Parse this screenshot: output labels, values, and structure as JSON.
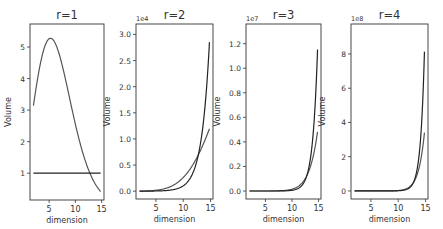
{
  "figure": {
    "width": 443,
    "height": 229
  },
  "chart_data": [
    {
      "type": "line",
      "title": "r=1",
      "xlabel": "dimension",
      "ylabel": "Volume",
      "offset_label": "",
      "r": 1,
      "x_range": [
        2,
        14.8
      ],
      "xlim": [
        1.35,
        15.45
      ],
      "ylim": [
        0.15,
        5.73
      ],
      "xticks": [
        5,
        10,
        15
      ],
      "yticks": [
        1,
        2,
        3,
        4,
        5
      ],
      "ytick_labels": [
        "1",
        "2",
        "3",
        "4",
        "5"
      ],
      "frame": {
        "left": 30,
        "top": 24,
        "right": 104,
        "bottom": 200
      },
      "x": [
        2,
        3,
        4,
        5,
        6,
        7,
        8,
        9,
        10,
        11,
        12,
        13,
        14,
        15
      ],
      "series": [
        {
          "name": "n-ball volume",
          "color": "#555555",
          "values": [
            3.1416,
            4.1888,
            4.9348,
            5.2638,
            5.1677,
            4.7248,
            4.0587,
            3.2985,
            2.5502,
            1.8841,
            1.3353,
            0.9106,
            0.5993,
            0.3814
          ]
        },
        {
          "name": "hypercube volume",
          "color": "#222222",
          "values": [
            1,
            1,
            1,
            1,
            1,
            1,
            1,
            1,
            1,
            1,
            1,
            1,
            1,
            1
          ]
        }
      ],
      "grid": false
    },
    {
      "type": "line",
      "title": "r=2",
      "xlabel": "dimension",
      "ylabel": "Volume",
      "offset_label": "1e4",
      "r": 2,
      "scale": 10000,
      "x_range": [
        2,
        14.8
      ],
      "xlim": [
        1.35,
        15.45
      ],
      "ylim": [
        -0.15,
        3.2
      ],
      "xticks": [
        5,
        10,
        15
      ],
      "yticks": [
        0,
        0.5,
        1.0,
        1.5,
        2.0,
        2.5,
        3.0
      ],
      "ytick_labels": [
        "0.0",
        "0.5",
        "1.0",
        "1.5",
        "2.0",
        "2.5",
        "3.0"
      ],
      "frame": {
        "left": 136,
        "top": 24,
        "right": 213,
        "bottom": 199
      },
      "x": [
        2,
        3,
        4,
        5,
        6,
        7,
        8,
        9,
        10,
        11,
        12,
        13,
        14,
        15
      ],
      "series": [
        {
          "name": "n-ball volume",
          "color": "#555555",
          "values": [
            12.57,
            33.51,
            78.96,
            168.4,
            330.7,
            604.8,
            1039,
            1689,
            2611,
            3859,
            5470,
            7459,
            9819,
            12498
          ]
        },
        {
          "name": "hypercube volume",
          "color": "#222222",
          "values": [
            4,
            8,
            16,
            32,
            64,
            128,
            256,
            512,
            1024,
            2048,
            4096,
            8192,
            16384,
            32768
          ]
        }
      ],
      "grid": false
    },
    {
      "type": "line",
      "title": "r=3",
      "xlabel": "dimension",
      "ylabel": "Volume",
      "offset_label": "1e7",
      "r": 3,
      "scale": 10000000,
      "x_range": [
        2,
        14.8
      ],
      "xlim": [
        1.35,
        15.45
      ],
      "ylim": [
        -0.065,
        1.36
      ],
      "xticks": [
        5,
        10,
        15
      ],
      "yticks": [
        0,
        0.2,
        0.4,
        0.6,
        0.8,
        1.0,
        1.2
      ],
      "ytick_labels": [
        "0.0",
        "0.2",
        "0.4",
        "0.6",
        "0.8",
        "1.0",
        "1.2"
      ],
      "frame": {
        "left": 246,
        "top": 24,
        "right": 321,
        "bottom": 199
      },
      "x": [
        2,
        3,
        4,
        5,
        6,
        7,
        8,
        9,
        10,
        11,
        12,
        13,
        14,
        15
      ],
      "series": [
        {
          "name": "n-ball volume",
          "color": "#555555",
          "values": [
            28.27,
            113.1,
            399.7,
            1279,
            3767,
            10333,
            26630,
            64923,
            150588,
            333759,
            709716,
            1451900,
            2866400,
            5472600
          ]
        },
        {
          "name": "hypercube volume",
          "color": "#222222",
          "values": [
            9,
            27,
            81,
            243,
            729,
            2187,
            6561,
            19683,
            59049,
            177147,
            531441,
            1594323,
            4782969,
            14348907
          ]
        }
      ],
      "grid": false
    },
    {
      "type": "line",
      "title": "r=4",
      "xlabel": "dimension",
      "ylabel": "Volume",
      "offset_label": "1e8",
      "r": 4,
      "scale": 100000000,
      "x_range": [
        2,
        14.8
      ],
      "xlim": [
        1.35,
        15.45
      ],
      "ylim": [
        -0.47,
        9.75
      ],
      "xticks": [
        5,
        10,
        15
      ],
      "yticks": [
        0,
        2,
        4,
        6,
        8
      ],
      "ytick_labels": [
        "0",
        "2",
        "4",
        "6",
        "8"
      ],
      "frame": {
        "left": 351,
        "top": 24,
        "right": 428,
        "bottom": 199
      },
      "x": [
        2,
        3,
        4,
        5,
        6,
        7,
        8,
        9,
        10,
        11,
        12,
        13,
        14,
        15
      ],
      "series": [
        {
          "name": "n-ball volume",
          "color": "#555555",
          "values": [
            50.27,
            268.1,
            1263,
            5390,
            21169,
            77408,
            265983,
            864676,
            2674065,
            7902700,
            22401650,
            61114320,
            160893000,
            409500000
          ]
        },
        {
          "name": "hypercube volume",
          "color": "#222222",
          "values": [
            16,
            64,
            256,
            1024,
            4096,
            16384,
            65536,
            262144,
            1048576,
            4194304,
            16777216,
            67108864,
            268435456,
            1073741824
          ]
        }
      ],
      "grid": false
    }
  ]
}
